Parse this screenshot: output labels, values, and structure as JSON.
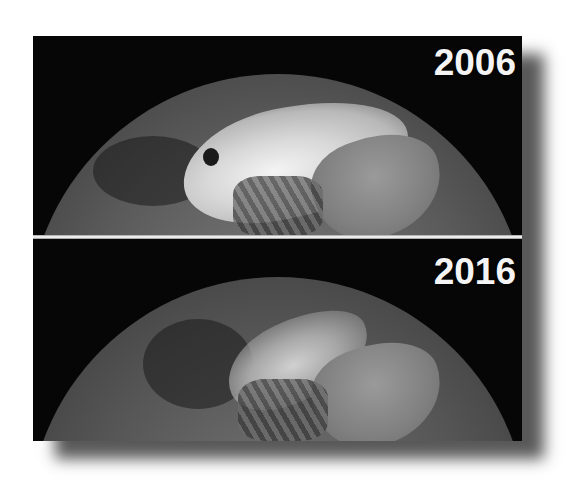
{
  "figure": {
    "panels": [
      {
        "year": "2006",
        "ice_extent": "large bright ice cap"
      },
      {
        "year": "2016",
        "ice_extent": "reduced ice cap"
      }
    ],
    "colors": {
      "background": "#ffffff",
      "space": "#050505",
      "label_text": "#f4f4f4",
      "separator": "#f2f2f2"
    }
  }
}
